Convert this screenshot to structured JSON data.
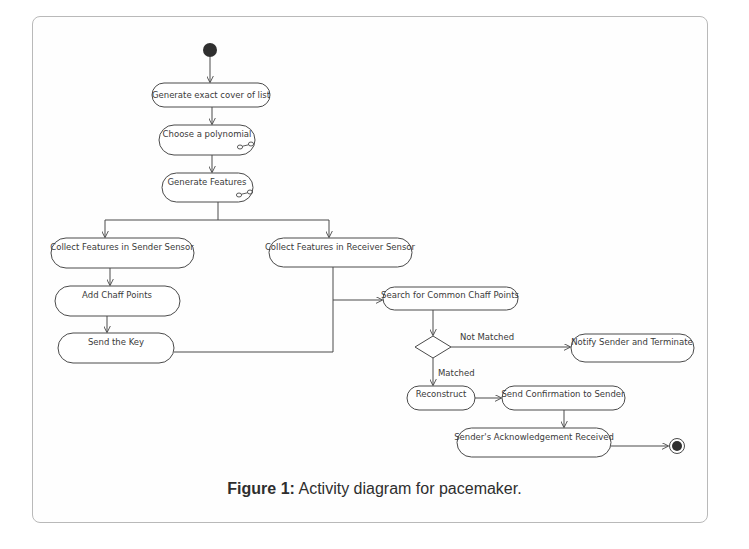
{
  "figure": {
    "caption_label": "Figure 1:",
    "caption_text": " Activity diagram for pacemaker."
  },
  "diagram": {
    "type": "UML activity diagram",
    "nodes": {
      "start": {
        "kind": "initial"
      },
      "n1": {
        "label": "Generate exact cover of list"
      },
      "n2": {
        "label": "Choose a polynomial",
        "icon": "subactivity-icon"
      },
      "n3": {
        "label": "Generate Features",
        "icon": "subactivity-icon"
      },
      "n4": {
        "label": "Collect Features in Sender Sensor"
      },
      "n5": {
        "label": "Collect Features in Receiver Sensor"
      },
      "n6": {
        "label": "Add Chaff Points"
      },
      "n7": {
        "label": "Send the Key"
      },
      "n8": {
        "label": "Search for Common Chaff Points"
      },
      "decision": {
        "kind": "decision"
      },
      "n9": {
        "label": "Notify Sender and Terminate"
      },
      "n10": {
        "label": "Reconstruct"
      },
      "n11": {
        "label": "Send Confirmation to Sender"
      },
      "n12": {
        "label": "Sender's Acknowledgement Received"
      },
      "end": {
        "kind": "final"
      }
    },
    "edges": [
      {
        "from": "start",
        "to": "n1"
      },
      {
        "from": "n1",
        "to": "n2"
      },
      {
        "from": "n2",
        "to": "n3"
      },
      {
        "from": "n3",
        "to": "n4"
      },
      {
        "from": "n3",
        "to": "n5"
      },
      {
        "from": "n4",
        "to": "n6"
      },
      {
        "from": "n6",
        "to": "n7"
      },
      {
        "from": "n7",
        "to": "n8"
      },
      {
        "from": "n5",
        "to": "n8"
      },
      {
        "from": "n8",
        "to": "decision"
      },
      {
        "from": "decision",
        "to": "n9",
        "label": "Not Matched"
      },
      {
        "from": "decision",
        "to": "n10",
        "label": "Matched"
      },
      {
        "from": "n10",
        "to": "n11"
      },
      {
        "from": "n11",
        "to": "n12"
      },
      {
        "from": "n12",
        "to": "end"
      }
    ],
    "edge_labels": {
      "not_matched": "Not Matched",
      "matched": "Matched"
    }
  },
  "colors": {
    "stroke": "#4a4a4a",
    "node_fill": "#ffffff",
    "initial_fill": "#2f2f2f",
    "frame_border": "#b9b9b9",
    "text": "#3a3a3a"
  }
}
